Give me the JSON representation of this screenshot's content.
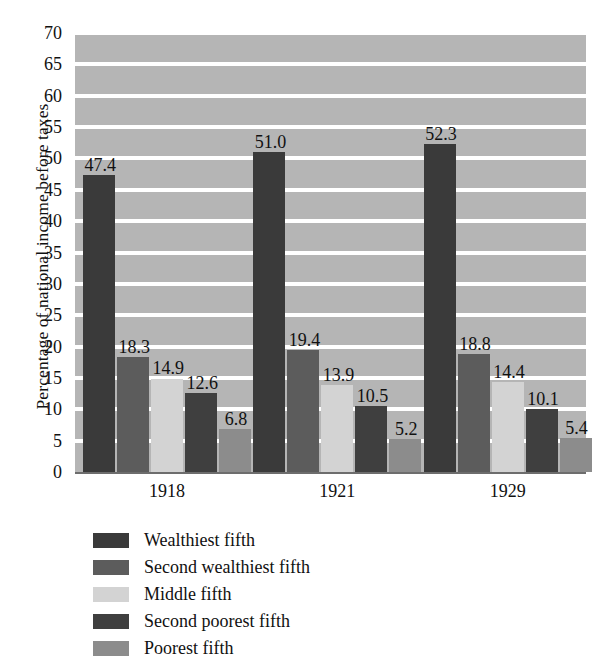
{
  "chart_data": {
    "type": "bar",
    "title": "",
    "subtitle": "",
    "xlabel": "",
    "ylabel": "Percentage of national income before taxes",
    "categories": [
      "1918",
      "1921",
      "1929"
    ],
    "ylim": [
      0,
      70
    ],
    "yticks": [
      0,
      5,
      10,
      15,
      20,
      25,
      30,
      35,
      40,
      45,
      50,
      55,
      60,
      65,
      70
    ],
    "ytick_labels": [
      "0",
      "5",
      "10",
      "15",
      "20",
      "25",
      "30",
      "35",
      "40",
      "45",
      "50",
      "55",
      "60",
      "65",
      "70"
    ],
    "grid": "horizontal",
    "grid_color": "#ffffff",
    "plot_background": "#b5b5b5",
    "legend_position": "below",
    "show_data_labels": true,
    "series": [
      {
        "name": "Wealthiest fifth",
        "color": "#3a3a3a",
        "values": [
          47.4,
          51.0,
          52.3
        ],
        "labels": [
          "47.4",
          "51.0",
          "52.3"
        ]
      },
      {
        "name": "Second wealthiest fifth",
        "color": "#5c5c5c",
        "values": [
          18.3,
          19.4,
          18.8
        ],
        "labels": [
          "18.3",
          "19.4",
          "18.8"
        ]
      },
      {
        "name": "Middle fifth",
        "color": "#d3d3d3",
        "values": [
          14.9,
          13.9,
          14.4
        ],
        "labels": [
          "14.9",
          "13.9",
          "14.4"
        ]
      },
      {
        "name": "Second poorest fifth",
        "color": "#3f3f3f",
        "values": [
          12.6,
          10.5,
          10.1
        ],
        "labels": [
          "12.6",
          "10.5",
          "10.1"
        ]
      },
      {
        "name": "Poorest fifth",
        "color": "#8c8c8c",
        "values": [
          6.8,
          5.2,
          5.4
        ],
        "labels": [
          "6.8",
          "5.2",
          "5.4"
        ]
      }
    ]
  }
}
